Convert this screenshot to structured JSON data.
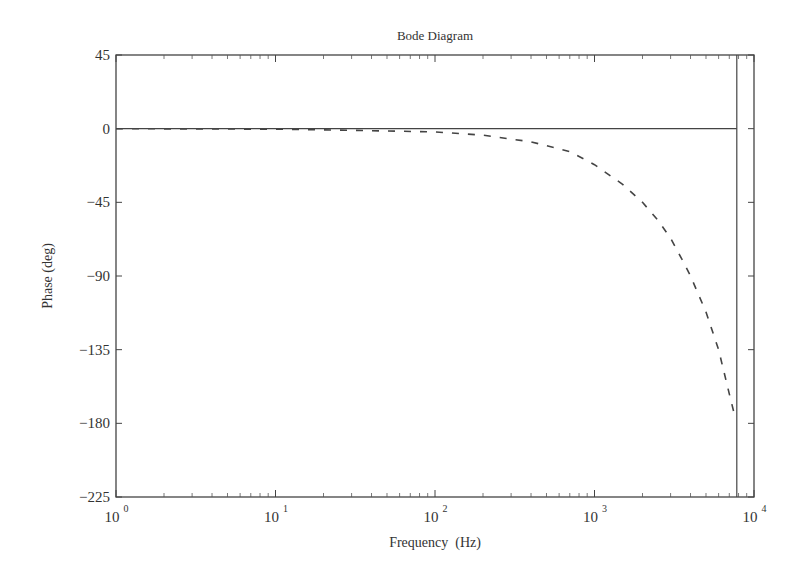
{
  "chart_data": {
    "type": "line",
    "title": "Bode Diagram",
    "xlabel": "Frequency  (Hz)",
    "ylabel": "Phase (deg)",
    "xscale": "log",
    "xlim": [
      1,
      10000
    ],
    "ylim": [
      -225,
      45
    ],
    "xticks": [
      {
        "base": "10",
        "exp": "0",
        "value": 1
      },
      {
        "base": "10",
        "exp": "1",
        "value": 10
      },
      {
        "base": "10",
        "exp": "2",
        "value": 100
      },
      {
        "base": "10",
        "exp": "3",
        "value": 1000
      },
      {
        "base": "10",
        "exp": "4",
        "value": 10000
      }
    ],
    "yticks": [
      "45",
      "0",
      "-45",
      "-90",
      "-135",
      "-180",
      "-225"
    ],
    "yticks_values": [
      45,
      0,
      -45,
      -90,
      -135,
      -180,
      -225
    ],
    "grid": false,
    "legend": null,
    "series": [
      {
        "name": "phase-dashed",
        "style": "dashed",
        "x": [
          1,
          10,
          30,
          100,
          200,
          400,
          700,
          1000,
          1500,
          2000,
          2500,
          3000,
          3500,
          4000,
          5000,
          6000,
          7000,
          7600
        ],
        "y": [
          0,
          -0.3,
          -1,
          -2,
          -4,
          -8,
          -14,
          -22,
          -34,
          -45,
          -56,
          -67,
          -79,
          -90,
          -112,
          -135,
          -162,
          -176
        ]
      },
      {
        "name": "zero-reference",
        "style": "solid",
        "x": [
          1,
          7800
        ],
        "y": [
          0,
          0
        ]
      },
      {
        "name": "vertical-marker",
        "style": "solid",
        "x": [
          7800,
          7800
        ],
        "y": [
          -225,
          45
        ]
      }
    ]
  }
}
